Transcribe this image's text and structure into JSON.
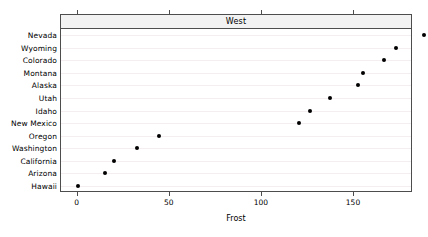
{
  "chart_data": {
    "type": "scatter",
    "title": "West",
    "xlabel": "Frost",
    "ylabel": "",
    "xlim": [
      -9,
      182
    ],
    "ylim": [
      0,
      14
    ],
    "grid": true,
    "legend": null,
    "xticks": [
      0,
      50,
      100,
      150
    ],
    "xticklabels": [
      "0",
      "50",
      "100",
      "150"
    ],
    "categories": [
      "Nevada",
      "Wyoming",
      "Colorado",
      "Montana",
      "Alaska",
      "Utah",
      "Idaho",
      "New Mexico",
      "Oregon",
      "Washington",
      "California",
      "Arizona",
      "Hawaii"
    ],
    "values": [
      188,
      173,
      166,
      155,
      152,
      137,
      126,
      120,
      44,
      32,
      20,
      15,
      0
    ],
    "points": [
      {
        "label": "Nevada",
        "value": 188
      },
      {
        "label": "Wyoming",
        "value": 173
      },
      {
        "label": "Colorado",
        "value": 166
      },
      {
        "label": "Montana",
        "value": 155
      },
      {
        "label": "Alaska",
        "value": 152
      },
      {
        "label": "Utah",
        "value": 137
      },
      {
        "label": "Idaho",
        "value": 126
      },
      {
        "label": "New Mexico",
        "value": 120
      },
      {
        "label": "Oregon",
        "value": 44
      },
      {
        "label": "Washington",
        "value": 32
      },
      {
        "label": "California",
        "value": 20
      },
      {
        "label": "Arizona",
        "value": 15
      },
      {
        "label": "Hawaii",
        "value": 0
      }
    ],
    "marker": {
      "shape": "circle",
      "color": "#000000",
      "size": 4
    },
    "colors": {
      "point": "#000000",
      "gridline": "#f5eef0",
      "axis": "#4d4d4d",
      "strip_background": "#f2f2f2",
      "background": "#ffffff",
      "text": "#000000"
    }
  },
  "strip": {
    "label": "West"
  },
  "axis": {
    "x_title": "Frost"
  }
}
